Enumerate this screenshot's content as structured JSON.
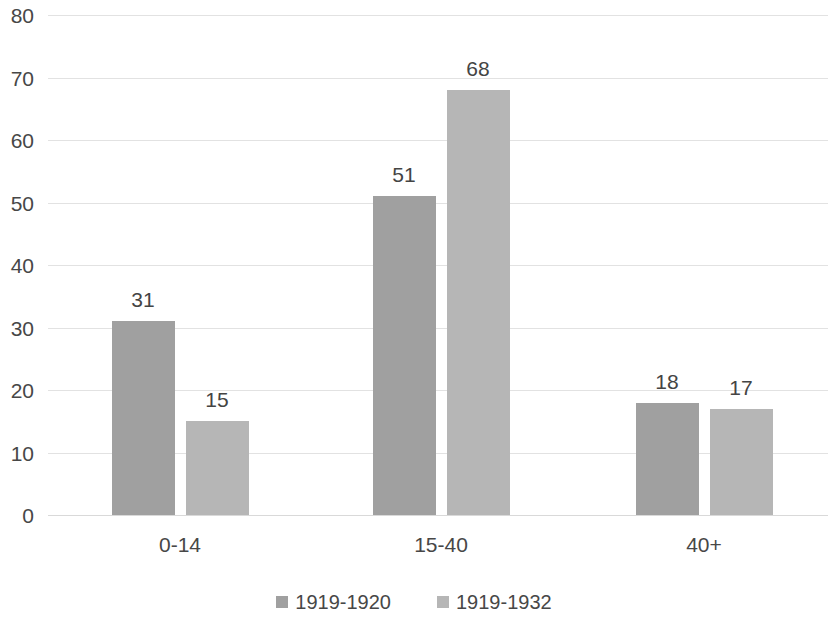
{
  "chart_data": {
    "type": "bar",
    "title": "",
    "subtitle": "",
    "xlabel": "",
    "ylabel": "",
    "categories": [
      "0-14",
      "15-40",
      "40+"
    ],
    "series": [
      {
        "name": "1919-1920",
        "values": [
          31,
          51,
          18
        ],
        "color": "#a0a0a0"
      },
      {
        "name": "1919-1932",
        "values": [
          15,
          68,
          17
        ],
        "color": "#b6b6b6"
      }
    ],
    "ylim": [
      0,
      80
    ],
    "y_ticks": [
      0,
      10,
      20,
      30,
      40,
      50,
      60,
      70,
      80
    ],
    "y_tick_labels": [
      "0",
      "10",
      "20",
      "30",
      "40",
      "50",
      "60",
      "70",
      "80"
    ],
    "data_labels": [
      [
        "31",
        "51",
        "18"
      ],
      [
        "15",
        "68",
        "17"
      ]
    ],
    "grid": true,
    "grid_color": "#e2e2e2",
    "legend_position": "bottom",
    "background_color": "#ffffff",
    "text_color": "#474747"
  }
}
